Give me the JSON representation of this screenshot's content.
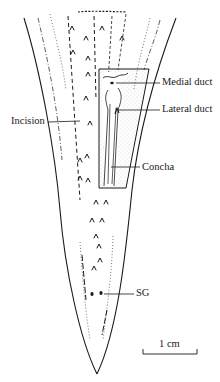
{
  "figure": {
    "labels": {
      "incision": "Incision",
      "medial_duct": "Medial duct",
      "lateral_duct": "Lateral duct",
      "concha": "Concha",
      "sg": "SG"
    },
    "scale_bar": {
      "label": "1 cm"
    },
    "colors": {
      "ink": "#1a1a1a",
      "background": "#ffffff",
      "stipple": "#555555"
    }
  }
}
